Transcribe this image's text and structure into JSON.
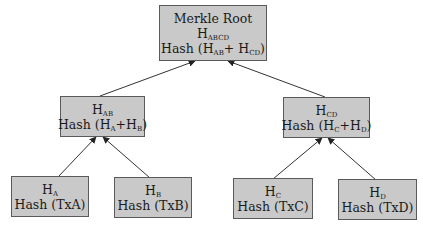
{
  "diagram": {
    "nodes": [
      {
        "id": "root",
        "title": "Merkle Root",
        "hash_name": "H",
        "hash_sub": "ABCD",
        "formula": {
          "prefix": "Hash (H",
          "sub1": "AB",
          "mid": "+ H",
          "sub2": "CD",
          "suffix": ")"
        }
      },
      {
        "id": "hab",
        "hash_name": "H",
        "hash_sub": "AB",
        "formula": {
          "prefix": "Hash (H",
          "sub1": "A",
          "mid": "+H",
          "sub2": "B",
          "suffix": ")"
        }
      },
      {
        "id": "hcd",
        "hash_name": "H",
        "hash_sub": "CD",
        "formula": {
          "prefix": "Hash (H",
          "sub1": "C",
          "mid": "+H",
          "sub2": "D",
          "suffix": ")"
        }
      },
      {
        "id": "ha",
        "hash_name": "H",
        "hash_sub": "A",
        "label": "Hash (TxA)"
      },
      {
        "id": "hb",
        "hash_name": "H",
        "hash_sub": "B",
        "label": "Hash (TxB)"
      },
      {
        "id": "hc",
        "hash_name": "H",
        "hash_sub": "C",
        "label": "Hash (TxC)"
      },
      {
        "id": "hd",
        "hash_name": "H",
        "hash_sub": "D",
        "label": "Hash (TxD)"
      }
    ],
    "edges": [
      {
        "from": "hab",
        "to": "root"
      },
      {
        "from": "hcd",
        "to": "root"
      },
      {
        "from": "ha",
        "to": "hab"
      },
      {
        "from": "hb",
        "to": "hab"
      },
      {
        "from": "hc",
        "to": "hcd"
      },
      {
        "from": "hd",
        "to": "hcd"
      }
    ],
    "colors": {
      "node_fill": "#c9c9c9",
      "node_border": "#5a5a5a",
      "edge": "#333333"
    }
  }
}
